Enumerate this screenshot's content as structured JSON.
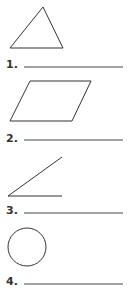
{
  "worksheet": {
    "items": [
      {
        "number": "1.",
        "shape": "triangle-icon",
        "answer": ""
      },
      {
        "number": "2.",
        "shape": "parallelogram-icon",
        "answer": ""
      },
      {
        "number": "3.",
        "shape": "angle-icon",
        "answer": ""
      },
      {
        "number": "4.",
        "shape": "circle-icon",
        "answer": ""
      }
    ]
  },
  "colors": {
    "stroke": "#333333",
    "background": "#ffffff"
  }
}
